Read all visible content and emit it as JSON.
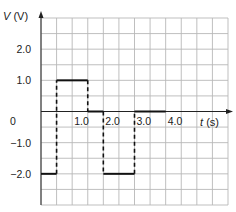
{
  "chart_data": {
    "type": "line",
    "subtype": "step",
    "title": "",
    "xlabel": "t (s)",
    "ylabel": "V (V)",
    "xlabel_var": "t",
    "xlabel_unit": "(s)",
    "ylabel_var": "V",
    "ylabel_unit": "(V)",
    "xlim": [
      0,
      6
    ],
    "ylim": [
      -3,
      3
    ],
    "grid": true,
    "grid_step_x": 0.5,
    "grid_step_y": 0.5,
    "x_ticks": [
      {
        "value": 1.0,
        "label": "1.0"
      },
      {
        "value": 2.0,
        "label": "2.0"
      },
      {
        "value": 3.0,
        "label": "3.0"
      },
      {
        "value": 4.0,
        "label": "4.0"
      }
    ],
    "y_ticks": [
      {
        "value": 2.0,
        "label": "2.0"
      },
      {
        "value": 1.0,
        "label": "1.0"
      },
      {
        "value": 0,
        "label": "0"
      },
      {
        "value": -1.0,
        "label": "-1.0"
      },
      {
        "value": -2.0,
        "label": "-2.0"
      }
    ],
    "segments": [
      {
        "t_start": 0.0,
        "t_end": 0.5,
        "V": -2.0
      },
      {
        "t_start": 0.5,
        "t_end": 1.5,
        "V": 1.0
      },
      {
        "t_start": 1.5,
        "t_end": 2.0,
        "V": 0.0
      },
      {
        "t_start": 2.0,
        "t_end": 3.0,
        "V": -2.0
      },
      {
        "t_start": 3.0,
        "t_end": 4.0,
        "V": 0.0
      }
    ],
    "transitions_dashed": [
      {
        "t": 0.5,
        "from": -2.0,
        "to": 1.0
      },
      {
        "t": 1.5,
        "from": 1.0,
        "to": 0.0
      },
      {
        "t": 2.0,
        "from": 0.0,
        "to": -2.0
      },
      {
        "t": 3.0,
        "from": -2.0,
        "to": 0.0
      }
    ],
    "colors": {
      "grid": "#b8b8b8",
      "axis": "#222222",
      "signal": "#111111"
    }
  }
}
